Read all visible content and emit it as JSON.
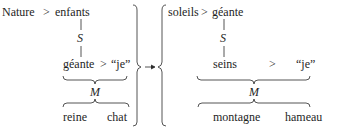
{
  "diagram": {
    "type": "transformation-scheme",
    "left": {
      "top": {
        "left": "Nature",
        "op": ">",
        "right": "enfants"
      },
      "link_label": "S",
      "middle": {
        "left": "géante",
        "op": ">",
        "right": "“je”"
      },
      "brace_label": "M",
      "bottom": {
        "left": "reine",
        "right": "chat"
      }
    },
    "arrow": "→",
    "right": {
      "top": {
        "left": "soleils",
        "op": ">",
        "right": "géante"
      },
      "link_label": "S",
      "middle": {
        "left": "seins",
        "op": ">",
        "right": "“je”"
      },
      "brace_label": "M",
      "bottom": {
        "left": "montagne",
        "right": "hameau"
      }
    }
  },
  "colors": {
    "ink": "#1e1e1e",
    "background": "#ffffff"
  }
}
